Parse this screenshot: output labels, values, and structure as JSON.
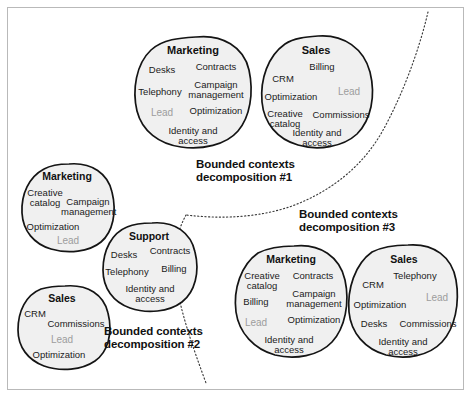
{
  "diagram": {
    "colors": {
      "blob_fill": "#f0f0f0",
      "blob_stroke": "#141414",
      "muted_text": "#9d9d9d",
      "text": "#1b1b1b",
      "frame": "#b9b9b9",
      "divider": "#3a3a3a"
    },
    "groups": [
      {
        "id": "decomposition-1",
        "line1": "Bounded contexts",
        "line2": "decomposition #1"
      },
      {
        "id": "decomposition-2",
        "line1": "Bounded contexts",
        "line2": "decomposition #2"
      },
      {
        "id": "decomposition-3",
        "line1": "Bounded contexts",
        "line2": "decomposition #3"
      }
    ],
    "blobs": [
      {
        "id": "marketing-1",
        "group": "decomposition-1",
        "title": "Marketing",
        "items": [
          {
            "label": "Desks",
            "muted": false
          },
          {
            "label": "Contracts",
            "muted": false
          },
          {
            "label": "Telephony",
            "muted": false
          },
          {
            "label": "Campaign management",
            "muted": false
          },
          {
            "label": "Lead",
            "muted": true
          },
          {
            "label": "Optimization",
            "muted": false
          },
          {
            "label": "Identity and access",
            "muted": false
          }
        ]
      },
      {
        "id": "sales-1",
        "group": "decomposition-1",
        "title": "Sales",
        "items": [
          {
            "label": "CRM",
            "muted": false
          },
          {
            "label": "Billing",
            "muted": false
          },
          {
            "label": "Optimization",
            "muted": false
          },
          {
            "label": "Lead",
            "muted": true
          },
          {
            "label": "Creative catalog",
            "muted": false
          },
          {
            "label": "Commissions",
            "muted": false
          },
          {
            "label": "Identity and access",
            "muted": false
          }
        ]
      },
      {
        "id": "marketing-2",
        "group": "decomposition-2",
        "title": "Marketing",
        "items": [
          {
            "label": "Creative catalog",
            "muted": false
          },
          {
            "label": "Campaign management",
            "muted": false
          },
          {
            "label": "Optimization",
            "muted": false
          },
          {
            "label": "Lead",
            "muted": true
          }
        ]
      },
      {
        "id": "support-2",
        "group": "decomposition-2",
        "title": "Support",
        "items": [
          {
            "label": "Desks",
            "muted": false
          },
          {
            "label": "Contracts",
            "muted": false
          },
          {
            "label": "Telephony",
            "muted": false
          },
          {
            "label": "Billing",
            "muted": false
          },
          {
            "label": "Identity and access",
            "muted": false
          }
        ]
      },
      {
        "id": "sales-2",
        "group": "decomposition-2",
        "title": "Sales",
        "items": [
          {
            "label": "CRM",
            "muted": false
          },
          {
            "label": "Commissions",
            "muted": false
          },
          {
            "label": "Lead",
            "muted": true
          },
          {
            "label": "Optimization",
            "muted": false
          }
        ]
      },
      {
        "id": "marketing-3",
        "group": "decomposition-3",
        "title": "Marketing",
        "items": [
          {
            "label": "Creative catalog",
            "muted": false
          },
          {
            "label": "Contracts",
            "muted": false
          },
          {
            "label": "Billing",
            "muted": false
          },
          {
            "label": "Campaign management",
            "muted": false
          },
          {
            "label": "Lead",
            "muted": true
          },
          {
            "label": "Optimization",
            "muted": false
          },
          {
            "label": "Identity and access",
            "muted": false
          }
        ]
      },
      {
        "id": "sales-3",
        "group": "decomposition-3",
        "title": "Sales",
        "items": [
          {
            "label": "CRM",
            "muted": false
          },
          {
            "label": "Telephony",
            "muted": false
          },
          {
            "label": "Lead",
            "muted": true
          },
          {
            "label": "Optimization",
            "muted": false
          },
          {
            "label": "Desks",
            "muted": false
          },
          {
            "label": "Commissions",
            "muted": false
          },
          {
            "label": "Identity and access",
            "muted": false
          }
        ]
      }
    ]
  }
}
